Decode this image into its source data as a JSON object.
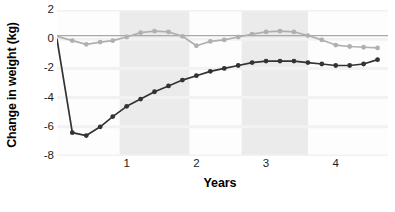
{
  "chart_data": {
    "type": "line",
    "title": "",
    "xlabel": "Years",
    "ylabel": "Change in weight (kg)",
    "xlim": [
      0,
      4.75
    ],
    "ylim": [
      -8,
      2
    ],
    "yticks": [
      2,
      0,
      -2,
      -4,
      -6,
      -8
    ],
    "ytick_labels": [
      "2",
      "0",
      "-2",
      "-4",
      "-6",
      "-8"
    ],
    "xticks": [
      1,
      2,
      3,
      4
    ],
    "xtick_labels": [
      "1",
      "2",
      "3",
      "4"
    ],
    "grid": "horizontal",
    "legend": "none",
    "shaded_bands": [
      {
        "x_start": 0.9,
        "x_end": 1.9,
        "color": "#ebebeb"
      },
      {
        "x_start": 2.65,
        "x_end": 3.6,
        "color": "#ebebeb"
      }
    ],
    "reference_line": {
      "y": 0.25,
      "color": "#a8a8a8",
      "label": ""
    },
    "series": [
      {
        "name": "surgery-group",
        "color": "#333333",
        "marker": "circle",
        "x": [
          0.0,
          0.22,
          0.42,
          0.62,
          0.8,
          1.0,
          1.2,
          1.4,
          1.6,
          1.8,
          2.0,
          2.2,
          2.4,
          2.6,
          2.8,
          3.0,
          3.2,
          3.4,
          3.6,
          3.8,
          4.0,
          4.2,
          4.4,
          4.6
        ],
        "y": [
          0.0,
          -6.4,
          -6.6,
          -6.0,
          -5.3,
          -4.6,
          -4.1,
          -3.6,
          -3.2,
          -2.8,
          -2.5,
          -2.2,
          -2.0,
          -1.8,
          -1.6,
          -1.5,
          -1.5,
          -1.5,
          -1.6,
          -1.7,
          -1.8,
          -1.8,
          -1.7,
          -1.4
        ]
      },
      {
        "name": "control-group",
        "color": "#b0b0b0",
        "marker": "circle",
        "x": [
          0.0,
          0.22,
          0.42,
          0.62,
          0.8,
          1.0,
          1.2,
          1.4,
          1.6,
          1.8,
          2.0,
          2.2,
          2.4,
          2.6,
          2.8,
          3.0,
          3.2,
          3.4,
          3.6,
          3.8,
          4.0,
          4.2,
          4.4,
          4.6
        ],
        "y": [
          0.2,
          -0.1,
          -0.35,
          -0.2,
          -0.1,
          0.15,
          0.45,
          0.55,
          0.5,
          0.2,
          -0.45,
          -0.15,
          -0.05,
          0.15,
          0.35,
          0.5,
          0.55,
          0.5,
          0.25,
          -0.05,
          -0.4,
          -0.5,
          -0.55,
          -0.6
        ]
      }
    ]
  },
  "colors": {
    "series_dark": "#333333",
    "series_light": "#b0b0b0",
    "reference_line": "#a8a8a8",
    "band": "#ebebeb",
    "gridline": "#f2f2f2",
    "plot_background": "#fdfdfd",
    "text": "#1d1d1d"
  }
}
